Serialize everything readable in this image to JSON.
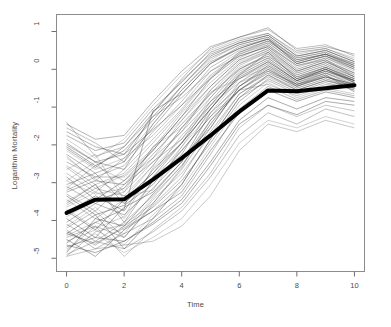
{
  "chart_data": {
    "type": "line",
    "title": "",
    "xlabel": "Time",
    "ylabel": "Logarithm Mortality",
    "xlim": [
      -0.35,
      10.35
    ],
    "ylim": [
      -5.35,
      1.45
    ],
    "xticks": [
      0,
      2,
      4,
      6,
      8,
      10
    ],
    "yticks": [
      1,
      0,
      -1,
      -2,
      -3,
      -4,
      -5
    ],
    "xtick_labels": [
      "0",
      "2",
      "4",
      "6",
      "8",
      "10"
    ],
    "ytick_labels": [
      "1",
      "0",
      "-1",
      "-2",
      "-3",
      "-4",
      "-5"
    ],
    "grid": false,
    "legend": "none",
    "box": "full-rectangle",
    "x": [
      0,
      1,
      2,
      3,
      4,
      5,
      6,
      7,
      8,
      9,
      10
    ],
    "mean_curve": {
      "name": "Mean trajectory",
      "style": "thick black line",
      "color": "#000000",
      "linewidth": 4,
      "values": [
        -3.8,
        -3.45,
        -3.44,
        -2.92,
        -2.35,
        -1.75,
        -1.12,
        -0.56,
        -0.58,
        -0.5,
        -0.42
      ]
    },
    "series": [
      {
        "name": "subject-01",
        "values": [
          -2.95,
          -3.3,
          -3.15,
          -2.05,
          -1.55,
          -0.6,
          -0.25,
          0.05,
          -0.35,
          -0.1,
          -0.45
        ]
      },
      {
        "name": "subject-02",
        "values": [
          -4.95,
          -4.3,
          -4.1,
          -3.55,
          -2.6,
          -1.35,
          -0.55,
          -0.4,
          -0.7,
          -0.45,
          -0.35
        ]
      },
      {
        "name": "subject-03",
        "values": [
          -1.4,
          -2.3,
          -2.05,
          -1.25,
          -0.75,
          -0.05,
          0.35,
          0.6,
          0.1,
          0.25,
          -0.2
        ]
      },
      {
        "name": "subject-04",
        "values": [
          -3.55,
          -3.05,
          -4.05,
          -2.95,
          -2.25,
          -1.05,
          -0.15,
          0.45,
          -0.25,
          0.05,
          -0.3
        ]
      },
      {
        "name": "subject-05",
        "values": [
          -4.6,
          -4.05,
          -3.7,
          -1.1,
          -0.65,
          0.15,
          0.55,
          0.8,
          0.15,
          0.35,
          0.0
        ]
      },
      {
        "name": "subject-06",
        "values": [
          -2.35,
          -2.9,
          -3.35,
          -3.2,
          -2.05,
          -0.95,
          -0.35,
          -0.05,
          -0.5,
          -0.25,
          -0.55
        ]
      },
      {
        "name": "subject-07",
        "values": [
          -3.15,
          -2.55,
          -2.95,
          -2.35,
          -1.35,
          -0.45,
          0.25,
          0.55,
          -0.05,
          0.2,
          -0.15
        ]
      },
      {
        "name": "subject-08",
        "values": [
          -4.35,
          -4.6,
          -4.2,
          -3.75,
          -3.05,
          -1.85,
          -0.75,
          -0.3,
          -0.65,
          -0.4,
          -0.5
        ]
      },
      {
        "name": "subject-09",
        "values": [
          -1.95,
          -2.45,
          -2.25,
          -1.6,
          -0.95,
          -0.25,
          0.45,
          0.75,
          0.2,
          0.4,
          0.15
        ]
      },
      {
        "name": "subject-10",
        "values": [
          -4.85,
          -3.95,
          -4.15,
          -3.3,
          -2.45,
          -1.15,
          -0.45,
          0.1,
          -0.4,
          -0.15,
          -0.6
        ]
      },
      {
        "name": "subject-11",
        "values": [
          -3.7,
          -4.2,
          -3.9,
          -2.6,
          -1.85,
          -0.75,
          0.05,
          0.35,
          -0.15,
          0.1,
          -0.25
        ]
      },
      {
        "name": "subject-12",
        "values": [
          -2.6,
          -3.15,
          -2.8,
          -2.1,
          -1.15,
          -0.35,
          0.3,
          0.65,
          0.05,
          0.3,
          -0.05
        ]
      },
      {
        "name": "subject-13",
        "values": [
          -4.25,
          -4.75,
          -4.35,
          -3.95,
          -3.35,
          -2.25,
          -1.05,
          -0.45,
          -0.8,
          -0.55,
          -0.7
        ]
      },
      {
        "name": "subject-14",
        "values": [
          -3.05,
          -2.75,
          -3.55,
          -2.85,
          -1.95,
          -0.85,
          -0.25,
          0.2,
          -0.3,
          0.0,
          -0.35
        ]
      },
      {
        "name": "subject-15",
        "values": [
          -4.7,
          -4.45,
          -4.55,
          -4.1,
          -3.55,
          -2.55,
          -1.45,
          -0.95,
          -1.2,
          -0.85,
          -0.95
        ]
      },
      {
        "name": "subject-16",
        "values": [
          -2.15,
          -2.65,
          -2.35,
          -1.45,
          -0.55,
          0.25,
          0.65,
          0.85,
          0.3,
          0.45,
          0.1
        ]
      },
      {
        "name": "subject-17",
        "values": [
          -3.9,
          -3.45,
          -3.25,
          -2.45,
          -1.65,
          -0.55,
          0.15,
          0.5,
          -0.1,
          0.15,
          -0.2
        ]
      },
      {
        "name": "subject-18",
        "values": [
          -4.45,
          -4.15,
          -4.45,
          -3.6,
          -2.85,
          -1.65,
          -0.65,
          -0.2,
          -0.55,
          -0.3,
          -0.45
        ]
      },
      {
        "name": "subject-19",
        "values": [
          -1.75,
          -2.15,
          -1.95,
          -1.05,
          -0.35,
          0.45,
          0.75,
          0.95,
          0.45,
          0.55,
          0.25
        ]
      },
      {
        "name": "subject-20",
        "values": [
          -3.35,
          -3.85,
          -3.6,
          -3.05,
          -2.15,
          -1.25,
          -0.55,
          -0.1,
          -0.45,
          -0.2,
          -0.4
        ]
      },
      {
        "name": "subject-21",
        "values": [
          -4.15,
          -3.65,
          -4.25,
          -3.4,
          -2.55,
          -1.45,
          -0.35,
          0.15,
          -0.35,
          -0.05,
          -0.3
        ]
      },
      {
        "name": "subject-22",
        "values": [
          -2.75,
          -3.25,
          -2.65,
          -1.85,
          -1.05,
          -0.15,
          0.4,
          0.7,
          0.15,
          0.35,
          0.05
        ]
      },
      {
        "name": "subject-23",
        "values": [
          -4.9,
          -4.55,
          -4.75,
          -4.3,
          -3.75,
          -2.85,
          -1.75,
          -1.15,
          -1.45,
          -1.05,
          -1.25
        ]
      },
      {
        "name": "subject-24",
        "values": [
          -3.25,
          -2.95,
          -3.05,
          -2.25,
          -1.45,
          -0.65,
          0.0,
          0.4,
          -0.2,
          0.05,
          -0.25
        ]
      },
      {
        "name": "subject-25",
        "values": [
          -2.05,
          -2.55,
          -2.15,
          -1.35,
          -0.45,
          0.35,
          0.7,
          0.9,
          0.35,
          0.5,
          0.2
        ]
      },
      {
        "name": "subject-26",
        "values": [
          -4.55,
          -4.25,
          -4.65,
          -3.85,
          -3.15,
          -2.05,
          -0.95,
          -0.35,
          -0.75,
          -0.5,
          -0.65
        ]
      },
      {
        "name": "subject-27",
        "values": [
          -3.45,
          -3.95,
          -3.45,
          -2.75,
          -1.75,
          -0.95,
          -0.05,
          0.3,
          -0.25,
          0.0,
          -0.35
        ]
      },
      {
        "name": "subject-28",
        "values": [
          -1.55,
          -1.95,
          -2.45,
          -1.15,
          -0.25,
          0.55,
          0.85,
          1.05,
          0.55,
          0.65,
          0.35
        ]
      },
      {
        "name": "subject-29",
        "values": [
          -4.05,
          -3.55,
          -3.85,
          -3.15,
          -2.35,
          -1.55,
          -0.45,
          0.0,
          -0.4,
          -0.1,
          -0.4
        ]
      },
      {
        "name": "subject-30",
        "values": [
          -2.85,
          -3.45,
          -2.95,
          -2.15,
          -1.25,
          -0.25,
          0.35,
          0.6,
          0.0,
          0.25,
          -0.1
        ]
      },
      {
        "name": "subject-31",
        "values": [
          -4.75,
          -4.35,
          -4.85,
          -4.45,
          -3.95,
          -3.05,
          -1.95,
          -1.35,
          -1.55,
          -1.25,
          -1.45
        ]
      },
      {
        "name": "subject-32",
        "values": [
          -3.6,
          -3.15,
          -3.35,
          -2.55,
          -1.55,
          -0.75,
          0.1,
          0.45,
          -0.15,
          0.1,
          -0.2
        ]
      },
      {
        "name": "subject-33",
        "values": [
          -2.45,
          -2.85,
          -2.55,
          -1.65,
          -0.85,
          0.05,
          0.5,
          0.75,
          0.25,
          0.4,
          0.1
        ]
      },
      {
        "name": "subject-34",
        "values": [
          -4.3,
          -4.65,
          -4.15,
          -3.65,
          -2.95,
          -1.95,
          -0.85,
          -0.25,
          -0.6,
          -0.35,
          -0.55
        ]
      },
      {
        "name": "subject-35",
        "values": [
          -3.8,
          -3.35,
          -3.75,
          -2.65,
          -1.95,
          -1.05,
          -0.15,
          0.25,
          -0.3,
          -0.05,
          -0.3
        ]
      },
      {
        "name": "subject-36",
        "values": [
          -1.85,
          -2.35,
          -1.85,
          -0.95,
          -0.15,
          0.5,
          0.8,
          0.95,
          0.4,
          0.55,
          0.3
        ]
      },
      {
        "name": "subject-37",
        "values": [
          -4.4,
          -4.05,
          -4.35,
          -3.45,
          -2.75,
          -1.75,
          -0.65,
          -0.15,
          -0.5,
          -0.25,
          -0.45
        ]
      },
      {
        "name": "subject-38",
        "values": [
          -3.1,
          -3.55,
          -3.15,
          -2.35,
          -1.65,
          -0.85,
          0.0,
          0.35,
          -0.2,
          0.05,
          -0.25
        ]
      },
      {
        "name": "subject-39",
        "values": [
          -2.25,
          -2.75,
          -2.45,
          -1.55,
          -0.65,
          0.15,
          0.6,
          0.8,
          0.3,
          0.45,
          0.15
        ]
      },
      {
        "name": "subject-40",
        "values": [
          -4.65,
          -4.85,
          -4.55,
          -4.05,
          -3.45,
          -2.45,
          -1.35,
          -0.75,
          -1.05,
          -0.75,
          -0.85
        ]
      },
      {
        "name": "subject-41",
        "values": [
          -3.5,
          -3.05,
          -3.95,
          -2.95,
          -2.05,
          -1.15,
          -0.25,
          0.15,
          -0.35,
          -0.1,
          -0.35
        ]
      },
      {
        "name": "subject-42",
        "values": [
          -2.55,
          -3.05,
          -2.75,
          -1.95,
          -1.1,
          -0.2,
          0.4,
          0.65,
          0.1,
          0.3,
          0.0
        ]
      },
      {
        "name": "subject-43",
        "values": [
          -4.2,
          -3.75,
          -4.45,
          -3.55,
          -2.65,
          -1.55,
          -0.45,
          0.05,
          -0.45,
          -0.15,
          -0.5
        ]
      },
      {
        "name": "subject-44",
        "values": [
          -1.65,
          -2.05,
          -2.25,
          -1.25,
          -0.45,
          0.3,
          0.65,
          0.85,
          0.25,
          0.4,
          0.05
        ]
      },
      {
        "name": "subject-45",
        "values": [
          -3.95,
          -4.45,
          -3.65,
          -3.25,
          -2.45,
          -1.35,
          -0.55,
          -0.05,
          -0.4,
          -0.2,
          -0.45
        ]
      },
      {
        "name": "subject-46",
        "values": [
          -2.95,
          -2.45,
          -3.25,
          -2.05,
          -1.35,
          -0.55,
          0.2,
          0.5,
          -0.05,
          0.2,
          -0.15
        ]
      },
      {
        "name": "subject-47",
        "values": [
          -4.8,
          -4.15,
          -4.95,
          -4.25,
          -3.65,
          -2.75,
          -1.55,
          -0.95,
          -1.25,
          -0.95,
          -1.1
        ]
      },
      {
        "name": "subject-48",
        "values": [
          -3.3,
          -3.75,
          -3.05,
          -2.45,
          -1.85,
          -0.95,
          -0.1,
          0.3,
          -0.25,
          0.0,
          -0.3
        ]
      },
      {
        "name": "subject-49",
        "values": [
          -2.1,
          -2.6,
          -2.05,
          -1.15,
          -0.3,
          0.4,
          0.7,
          0.9,
          0.35,
          0.5,
          0.2
        ]
      },
      {
        "name": "subject-50",
        "values": [
          -4.5,
          -4.95,
          -4.25,
          -3.75,
          -3.25,
          -2.15,
          -1.15,
          -0.55,
          -0.85,
          -0.6,
          -0.75
        ]
      },
      {
        "name": "subject-51",
        "values": [
          -3.65,
          -3.25,
          -3.55,
          -2.85,
          -2.15,
          -1.25,
          -0.35,
          0.1,
          -0.3,
          -0.05,
          -0.35
        ]
      },
      {
        "name": "subject-52",
        "values": [
          -2.3,
          -2.95,
          -2.35,
          -1.75,
          -0.95,
          -0.05,
          0.45,
          0.7,
          0.15,
          0.35,
          0.05
        ]
      },
      {
        "name": "subject-53",
        "values": [
          -4.1,
          -4.55,
          -4.05,
          -3.35,
          -2.55,
          -1.45,
          -0.55,
          0.0,
          -0.45,
          -0.2,
          -0.4
        ]
      },
      {
        "name": "subject-54",
        "values": [
          -1.45,
          -1.85,
          -1.75,
          -0.85,
          -0.05,
          0.6,
          0.85,
          1.1,
          0.5,
          0.6,
          0.4
        ]
      },
      {
        "name": "subject-55",
        "values": [
          -3.75,
          -4.25,
          -3.45,
          -2.75,
          -1.95,
          -1.05,
          -0.2,
          0.2,
          -0.3,
          0.0,
          -0.3
        ]
      },
      {
        "name": "subject-56",
        "values": [
          -2.65,
          -2.25,
          -3.45,
          -2.55,
          -1.55,
          -0.65,
          0.15,
          0.45,
          -0.1,
          0.15,
          -0.2
        ]
      },
      {
        "name": "subject-57",
        "values": [
          -4.95,
          -4.75,
          -4.65,
          -4.55,
          -4.15,
          -3.35,
          -2.15,
          -1.45,
          -1.65,
          -1.35,
          -1.55
        ]
      },
      {
        "name": "subject-58",
        "values": [
          -3.2,
          -2.85,
          -2.85,
          -2.15,
          -1.25,
          -0.45,
          0.25,
          0.55,
          -0.05,
          0.2,
          -0.1
        ]
      },
      {
        "name": "subject-59",
        "values": [
          -2.0,
          -2.45,
          -2.65,
          -1.45,
          -0.55,
          0.2,
          0.55,
          0.8,
          0.2,
          0.4,
          0.1
        ]
      },
      {
        "name": "subject-60",
        "values": [
          -4.35,
          -3.85,
          -4.75,
          -3.95,
          -3.05,
          -1.85,
          -0.75,
          -0.15,
          -0.55,
          -0.3,
          -0.5
        ]
      }
    ],
    "colors": {
      "line": "#3a3a3a",
      "mean_line": "#000000",
      "axis": "#6e6e6e",
      "background": "#ffffff"
    }
  }
}
